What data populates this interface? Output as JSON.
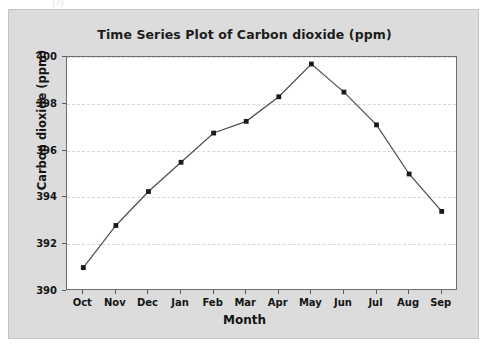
{
  "chart_data": {
    "type": "line",
    "title": "Time Series Plot of Carbon dioxide (ppm)",
    "xlabel": "Month",
    "ylabel": "Carbon dioxide (ppm)",
    "categories": [
      "Oct",
      "Nov",
      "Dec",
      "Jan",
      "Feb",
      "Mar",
      "Apr",
      "May",
      "Jun",
      "Jul",
      "Aug",
      "Sep"
    ],
    "values": [
      391.0,
      392.8,
      394.25,
      395.5,
      396.75,
      397.25,
      398.3,
      399.7,
      398.5,
      397.1,
      395.0,
      393.4
    ],
    "ylim": [
      390,
      400
    ],
    "yticks": [
      390,
      392,
      394,
      396,
      398,
      400
    ],
    "ytick_labels": [
      "390",
      "392",
      "394",
      "396",
      "398",
      "400"
    ],
    "grid": "horizontal-dashed",
    "legend": "none",
    "series_color": "#4d4d4d",
    "marker": "square",
    "marker_color": "#1a1a1a",
    "plot_background": "#ffffff",
    "figure_background": "#dcdcdc",
    "grid_color": "#d6d6d6"
  },
  "artifacts": {
    "top_mark": "(?)"
  }
}
